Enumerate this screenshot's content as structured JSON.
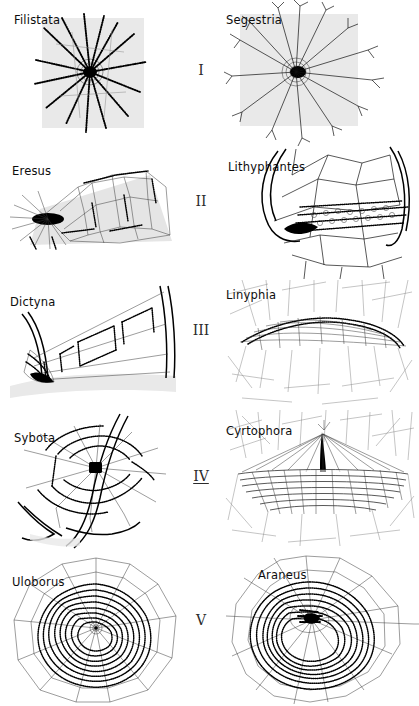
{
  "figure": {
    "type": "comparative-plate",
    "columns": 2,
    "rows": 5,
    "background_color": "#ffffff",
    "ink_color": "#111111",
    "shading_color": "#e9e9e9"
  },
  "rows": [
    {
      "numeral": "I",
      "numeral_underlined": false,
      "left": {
        "genus": "Filistata",
        "web_type": "radial signal lines from tube retreat",
        "label_x": 14,
        "label_y": 13
      },
      "right": {
        "genus": "Segestria",
        "web_type": "radial signal lines, branched tips",
        "label_x": 226,
        "label_y": 13
      }
    },
    {
      "numeral": "II",
      "numeral_underlined": false,
      "left": {
        "genus": "Eresus",
        "web_type": "irregular tangle over retreat",
        "label_x": 12,
        "label_y": 164
      },
      "right": {
        "genus": "Lithyphantes",
        "web_type": "irregular space web with retreat",
        "label_x": 228,
        "label_y": 160
      }
    },
    {
      "numeral": "III",
      "numeral_underlined": false,
      "left": {
        "genus": "Dictyna",
        "web_type": "cribellate sheet between leaf edges",
        "label_x": 10,
        "label_y": 295
      },
      "right": {
        "genus": "Linyphia",
        "web_type": "domed sheet web with scaffolding",
        "label_x": 226,
        "label_y": 288
      }
    },
    {
      "numeral": "IV",
      "numeral_underlined": true,
      "left": {
        "genus": "Sybota",
        "web_type": "reduced orb with radii and spiral",
        "label_x": 14,
        "label_y": 431
      },
      "right": {
        "genus": "Cyrtophora",
        "web_type": "horizontal orb sheet with tent apex",
        "label_x": 226,
        "label_y": 424
      }
    },
    {
      "numeral": "V",
      "numeral_underlined": false,
      "left": {
        "genus": "Uloborus",
        "web_type": "complete cribellate orb web",
        "label_x": 12,
        "label_y": 575
      },
      "right": {
        "genus": "Araneus",
        "web_type": "complete ecribellate orb web",
        "label_x": 258,
        "label_y": 568
      }
    }
  ]
}
